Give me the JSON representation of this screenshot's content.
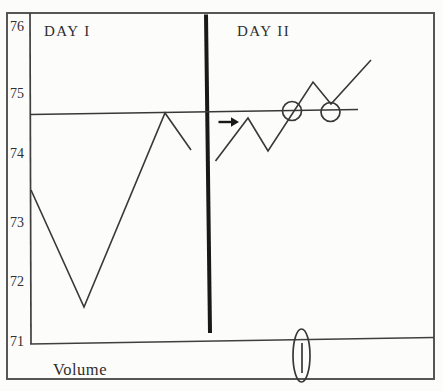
{
  "figure": {
    "day1_label": "DAY I",
    "day2_label": "DAY II",
    "volume_label": "Volume",
    "y_axis_labels": [
      "76",
      "75",
      "74",
      "73",
      "72",
      "71"
    ],
    "colors": {
      "ink": "#383838",
      "bold_ink": "#191919",
      "border": "#565656",
      "paper": "#fcfcfb"
    }
  },
  "chart_data": {
    "type": "line",
    "title": "",
    "xlabel": "",
    "ylabel": "",
    "ylim": [
      71,
      76
    ],
    "y_ticks": [
      76,
      75,
      74,
      73,
      72,
      71
    ],
    "grid": "off",
    "legend": "none",
    "resistance_level": 74.65,
    "series": [
      {
        "name": "DAY I price",
        "prices": [
          73.4,
          71.6,
          74.65,
          74.05
        ]
      },
      {
        "name": "DAY II price",
        "prices": [
          73.95,
          74.55,
          74.05,
          75.15,
          74.8,
          75.5
        ]
      }
    ],
    "annotations": [
      {
        "type": "horizontal-line",
        "level": 74.65,
        "note": "resistance drawn from Day I peak across Day II"
      },
      {
        "type": "arrow",
        "session": "DAY II",
        "at_price": 74.5
      },
      {
        "type": "circle",
        "session": "DAY II",
        "at_price": 74.65,
        "event": "breakout crossing of resistance"
      },
      {
        "type": "circle",
        "session": "DAY II",
        "at_price": 74.65,
        "event": "pullback retest of resistance"
      },
      {
        "type": "ellipse",
        "panel": "volume",
        "event": "single volume bar circled at breakout"
      }
    ],
    "volume_panel_label": "Volume"
  },
  "geometry": {
    "canvas": {
      "w": 443,
      "h": 391
    },
    "shapes": [
      {
        "kind": "rect",
        "name": "outer-border",
        "x": 7,
        "y": 13,
        "w": 427,
        "h": 366,
        "stroke": "#565656",
        "sw": 2
      },
      {
        "kind": "line",
        "name": "price-y-axis",
        "x1": 30,
        "y1": 13,
        "x2": 31,
        "y2": 344,
        "stroke": "#3f3f3f",
        "sw": 1.7
      },
      {
        "kind": "line",
        "name": "price-bottom-axis",
        "x1": 30,
        "y1": 344,
        "x2": 434,
        "y2": 337.5,
        "stroke": "#3f3f3f",
        "sw": 1.7
      },
      {
        "kind": "line",
        "name": "day-divider",
        "x1": 206,
        "y1": 14.5,
        "x2": 210,
        "y2": 333,
        "stroke": "#191919",
        "sw": 4
      },
      {
        "kind": "line",
        "name": "resistance-line",
        "x1": 30,
        "y1": 114.5,
        "x2": 358,
        "y2": 109.5,
        "stroke": "#383838",
        "sw": 1.5
      },
      {
        "kind": "polyline",
        "name": "day1-price-line",
        "points": "31,190 84,307 165,113 191,150",
        "stroke": "#383838",
        "sw": 1.6
      },
      {
        "kind": "polyline",
        "name": "day2-price-line",
        "points": "215.5,161 248,118 268,151 313,82 331,104 371,60",
        "stroke": "#383838",
        "sw": 1.6
      },
      {
        "kind": "line",
        "name": "breakout-arrow-shaft",
        "x1": 218.5,
        "y1": 122,
        "x2": 232,
        "y2": 122,
        "stroke": "#191919",
        "sw": 2.4
      },
      {
        "kind": "polygon",
        "name": "breakout-arrow-head",
        "points": "231,117.2 239,122 231,126.8",
        "fill": "#191919"
      },
      {
        "kind": "circle",
        "name": "breakout-circle",
        "cx": 292,
        "cy": 111,
        "r": 9.5,
        "stroke": "#383838",
        "sw": 1.7
      },
      {
        "kind": "circle",
        "name": "retest-circle",
        "cx": 330.5,
        "cy": 112,
        "r": 9.5,
        "stroke": "#383838",
        "sw": 1.7
      },
      {
        "kind": "line",
        "name": "volume-bar",
        "x1": 302,
        "y1": 343,
        "x2": 302,
        "y2": 373,
        "stroke": "#383838",
        "sw": 1.7
      },
      {
        "kind": "ellipse",
        "name": "volume-spike-ellipse",
        "cx": 301.5,
        "cy": 355.5,
        "rx": 8.5,
        "ry": 26.5,
        "stroke": "#383838",
        "sw": 1.7
      }
    ]
  }
}
